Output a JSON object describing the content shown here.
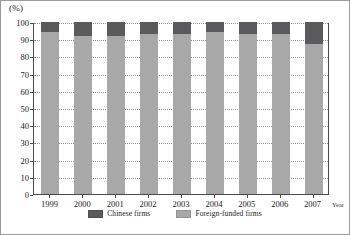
{
  "chart_data": {
    "type": "bar",
    "stacked": true,
    "title": "",
    "xlabel": "Year",
    "ylabel": "(%)",
    "ylim": [
      0,
      100
    ],
    "yticks": [
      0,
      10,
      20,
      30,
      40,
      50,
      60,
      70,
      80,
      90,
      100
    ],
    "grid": true,
    "legend_position": "bottom-center",
    "categories": [
      "1999",
      "2000",
      "2001",
      "2002",
      "2003",
      "2004",
      "2005",
      "2006",
      "2007"
    ],
    "series": [
      {
        "name": "Foreign-funded firms",
        "color": "#a8a8a8",
        "values": [
          94,
          92,
          92,
          93,
          93,
          94,
          93,
          93,
          87
        ]
      },
      {
        "name": "Chinese firms",
        "color": "#5a5a5c",
        "values": [
          6,
          8,
          8,
          7,
          7,
          6,
          7,
          7,
          13
        ]
      }
    ]
  },
  "axes": {
    "unit_label": "(%)",
    "x_axis_title": "Year"
  },
  "legend": {
    "items": [
      {
        "label": "Chinese firms",
        "color": "#5a5a5c"
      },
      {
        "label": "Foreign-funded firms",
        "color": "#a8a8a8"
      }
    ]
  },
  "colors": {
    "chinese_firms": "#5a5a5c",
    "foreign_funded_firms": "#a8a8a8",
    "axis": "#4a4a4a",
    "gridline": "#8f8f8f",
    "figure_border": "#9a9a9a"
  }
}
